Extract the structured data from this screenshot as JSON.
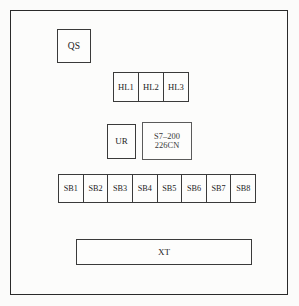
{
  "diagram": {
    "frame": {
      "label": "panel-enclosure"
    },
    "components": {
      "disconnect_switch": {
        "label": "QS"
      },
      "indicator_lamps": [
        {
          "label": "HL1"
        },
        {
          "label": "HL2"
        },
        {
          "label": "HL3"
        }
      ],
      "relay": {
        "label": "UR"
      },
      "plc": {
        "line1": "S7–200",
        "line2": "226CN"
      },
      "breakers": [
        {
          "label": "SB1"
        },
        {
          "label": "SB2"
        },
        {
          "label": "SB3"
        },
        {
          "label": "SB4"
        },
        {
          "label": "SB5"
        },
        {
          "label": "SB6"
        },
        {
          "label": "SB7"
        },
        {
          "label": "SB8"
        }
      ],
      "terminal_block": {
        "label": "XT"
      }
    },
    "colors": {
      "stroke": "#3a3a3a",
      "frame_stroke": "#2a2a2a",
      "background": "#fbfbfa",
      "text": "#1c1c1c"
    }
  }
}
